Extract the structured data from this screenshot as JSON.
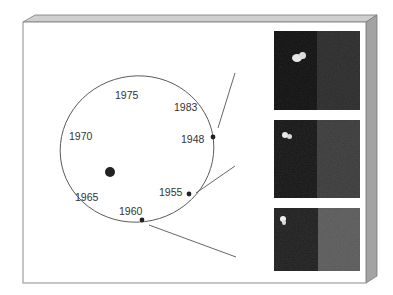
{
  "figure": {
    "title": "",
    "orbit": {
      "center_body": "star",
      "labels": [
        {
          "id": "y1975",
          "text": "1975",
          "x": 115,
          "y": 89
        },
        {
          "id": "y1983",
          "text": "1983",
          "x": 174,
          "y": 101
        },
        {
          "id": "y1970",
          "text": "1970",
          "x": 69,
          "y": 131
        },
        {
          "id": "y1948",
          "text": "1948",
          "x": 181,
          "y": 134
        },
        {
          "id": "y1965",
          "text": "1965",
          "x": 74,
          "y": 191
        },
        {
          "id": "y1955",
          "text": "1955",
          "x": 159,
          "y": 187
        },
        {
          "id": "y1960",
          "text": "1960",
          "x": 119,
          "y": 207
        }
      ],
      "marked_points": [
        {
          "year": "1948",
          "x": 213,
          "y": 137
        },
        {
          "year": "1955",
          "x": 189,
          "y": 194
        },
        {
          "year": "1960",
          "x": 142,
          "y": 220
        }
      ]
    },
    "image_panels": [
      {
        "id": "panel-1",
        "year": "1948",
        "dark": "#0f0f0f",
        "light": "#2c2c2c",
        "blob": {
          "x": 22,
          "y": 28
        }
      },
      {
        "id": "panel-2",
        "year": "1955",
        "dark": "#141414",
        "light": "#3c3c3c",
        "blob": {
          "x": 11,
          "y": 14
        }
      },
      {
        "id": "panel-3",
        "year": "1960",
        "dark": "#1e1e1e",
        "light": "#5a5a5a",
        "blob": {
          "x": 8,
          "y": 12
        }
      }
    ],
    "colors": {
      "frame_top": "#c8c8c8",
      "frame_side": "#a3a3a3",
      "frame_edge": "#7a7a7a",
      "orbit_line": "#555555",
      "dot": "#222222"
    }
  }
}
